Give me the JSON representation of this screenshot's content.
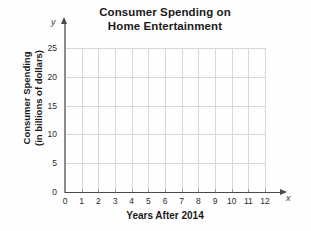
{
  "chart_data": {
    "type": "line",
    "title": "Consumer Spending on Home Entertainment",
    "title_lines": [
      "Consumer Spending on",
      "Home Entertainment"
    ],
    "xlabel": "Years After 2014",
    "ylabel": "Consumer Spending (in billions of dollars)",
    "ylabel_lines": [
      "Consumer Spending",
      "(in billions of dollars)"
    ],
    "x_axis_letter": "x",
    "y_axis_letter": "y",
    "x_ticks": [
      0,
      1,
      2,
      3,
      4,
      5,
      6,
      7,
      8,
      9,
      10,
      11,
      12
    ],
    "y_ticks": [
      0,
      5,
      10,
      15,
      20,
      25
    ],
    "xlim": [
      0,
      12
    ],
    "ylim": [
      0,
      25
    ],
    "grid": true,
    "legend": null,
    "series": [],
    "values": [],
    "categories": [],
    "annotations": [],
    "note": "Empty coordinate grid, no data plotted",
    "colors": {
      "gridline": "#d7d7d7",
      "axis": "#4a4a4a",
      "text": "#1a1a1a",
      "background": "#fefefe"
    }
  }
}
